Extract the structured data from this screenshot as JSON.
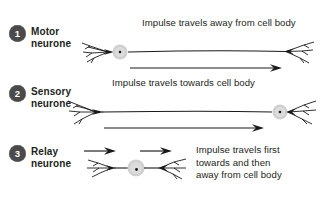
{
  "figure": {
    "background_color": "#ffffff",
    "text_color": "#231f20",
    "badge_color": "#4a4a4a",
    "badge_text_color": "#ffffff",
    "cell_body_color": "#cfcfcf",
    "nucleus_color": "#1a1a1a",
    "line_color": "#1a1a1a"
  },
  "rows": [
    {
      "number": "1",
      "name": "Motor\nneurone",
      "caption": "Impulse travels away from cell body",
      "impulse_direction": "left-to-right",
      "cell_body_position": "left",
      "icon": "motor-neurone-icon"
    },
    {
      "number": "2",
      "name": "Sensory\nneurone",
      "caption": "Impulse travels towards cell body",
      "impulse_direction": "left-to-right",
      "cell_body_position": "right",
      "icon": "sensory-neurone-icon"
    },
    {
      "number": "3",
      "name": "Relay\nneurone",
      "caption": "Impulse travels first\ntowards and then\naway from cell body",
      "impulse_direction": "both-left-to-right",
      "cell_body_position": "center",
      "icon": "relay-neurone-icon"
    }
  ]
}
